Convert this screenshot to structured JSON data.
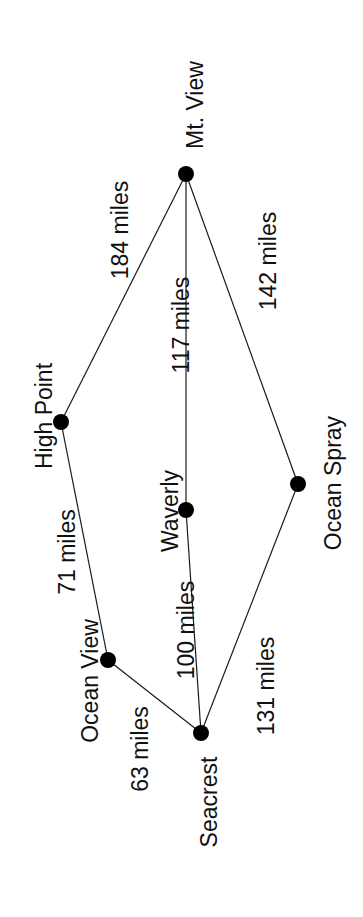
{
  "diagram": {
    "type": "weighted-graph",
    "background": "#ffffff",
    "ink_color": "#000000",
    "nodes": [
      {
        "id": "mt_view",
        "label": "Mt. View",
        "x": 186,
        "y": 174
      },
      {
        "id": "high_point",
        "label": "High Point",
        "x": 61,
        "y": 422
      },
      {
        "id": "waverly",
        "label": "Waverly",
        "x": 186,
        "y": 510
      },
      {
        "id": "ocean_spray",
        "label": "Ocean Spray",
        "x": 298,
        "y": 484
      },
      {
        "id": "ocean_view",
        "label": "Ocean View",
        "x": 108,
        "y": 660
      },
      {
        "id": "seacrest",
        "label": "Seacrest",
        "x": 201,
        "y": 733
      }
    ],
    "edges": [
      {
        "from": "mt_view",
        "to": "high_point",
        "miles": 184,
        "label": "184 miles"
      },
      {
        "from": "mt_view",
        "to": "waverly",
        "miles": 117,
        "label": "117 miles"
      },
      {
        "from": "mt_view",
        "to": "ocean_spray",
        "miles": 142,
        "label": "142 miles"
      },
      {
        "from": "high_point",
        "to": "ocean_view",
        "miles": 71,
        "label": "71 miles"
      },
      {
        "from": "waverly",
        "to": "seacrest",
        "miles": 100,
        "label": "100 miles"
      },
      {
        "from": "ocean_view",
        "to": "seacrest",
        "miles": 63,
        "label": "63 miles"
      },
      {
        "from": "ocean_spray",
        "to": "seacrest",
        "miles": 131,
        "label": "131 miles"
      }
    ],
    "node_label_positions": [
      {
        "id": "mt_view",
        "cx": 195,
        "cy": 105
      },
      {
        "id": "high_point",
        "cx": 44,
        "cy": 416
      },
      {
        "id": "waverly",
        "cx": 170,
        "cy": 511
      },
      {
        "id": "ocean_spray",
        "cx": 333,
        "cy": 483
      },
      {
        "id": "ocean_view",
        "cx": 90,
        "cy": 681
      },
      {
        "id": "seacrest",
        "cx": 209,
        "cy": 802
      }
    ],
    "edge_label_positions": [
      {
        "index": 0,
        "cx": 120,
        "cy": 230
      },
      {
        "index": 1,
        "cx": 181,
        "cy": 325
      },
      {
        "index": 2,
        "cx": 268,
        "cy": 261
      },
      {
        "index": 3,
        "cx": 67,
        "cy": 552
      },
      {
        "index": 4,
        "cx": 186,
        "cy": 630
      },
      {
        "index": 5,
        "cx": 140,
        "cy": 749
      },
      {
        "index": 6,
        "cx": 266,
        "cy": 686
      }
    ]
  }
}
